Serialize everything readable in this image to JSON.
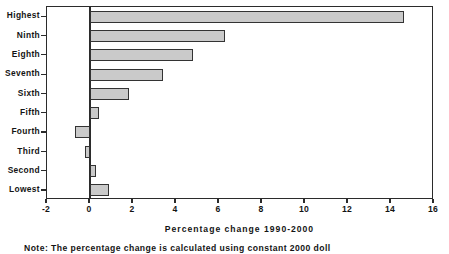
{
  "chart_data": {
    "type": "bar",
    "orientation": "horizontal",
    "title": "",
    "xlabel": "Percentage change 1990-2000",
    "ylabel": "",
    "xlim": [
      -2,
      16
    ],
    "xticks": [
      -2,
      0,
      2,
      4,
      6,
      8,
      10,
      12,
      14,
      16
    ],
    "xticklabels": [
      "-2",
      "0",
      "2",
      "4",
      "6",
      "8",
      "10",
      "12",
      "14",
      "16"
    ],
    "grid": false,
    "legend": false,
    "categories": [
      "Highest",
      "Ninth",
      "Eighth",
      "Seventh",
      "Sixth",
      "Fifth",
      "Fourth",
      "Third",
      "Second",
      "Lowest"
    ],
    "values": [
      14.6,
      6.3,
      4.8,
      3.4,
      1.8,
      0.4,
      -0.7,
      -0.25,
      0.3,
      0.9
    ],
    "bar_color": "#cacaca",
    "bar_edge_color": "#333333",
    "axis_color": "#2b2b2b"
  },
  "note": {
    "text": "Note: The percentage change is calculated using constant 2000 doll"
  }
}
